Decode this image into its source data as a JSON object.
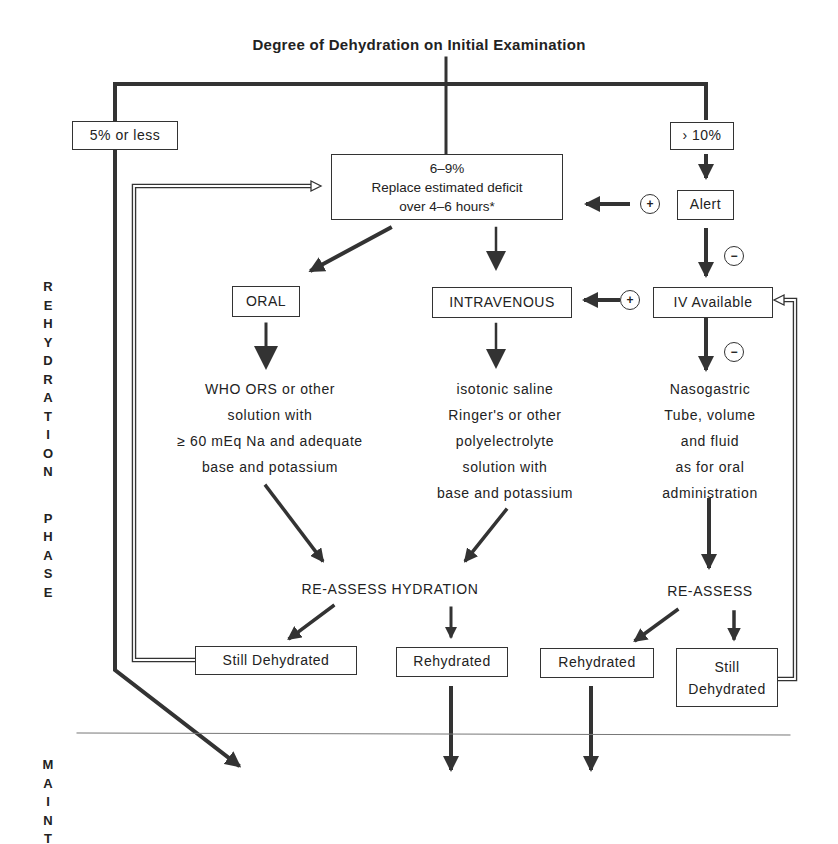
{
  "title": "Degree of Dehydration on Initial Examination",
  "severity": {
    "mild": "5% or less",
    "moderate": [
      "6–9%",
      "Replace estimated deficit",
      "over 4–6 hours*"
    ],
    "severe": "› 10%"
  },
  "decisions": {
    "alert": "Alert",
    "iv_available": "IV Available",
    "alert_yes_sign": "+",
    "alert_no_sign": "−",
    "iv_yes_sign": "+",
    "iv_no_sign": "−"
  },
  "routes": {
    "oral": "ORAL",
    "intravenous": "INTRAVENOUS"
  },
  "solutions": {
    "oral": [
      "WHO ORS or other",
      "solution with",
      "≥ 60 mEq Na and adequate",
      "base and potassium"
    ],
    "iv": [
      "isotonic saline",
      "Ringer's or other",
      "polyelectrolyte",
      "solution with",
      "base and potassium"
    ],
    "ng": [
      "Nasogastric",
      "Tube, volume",
      "and fluid",
      "as for oral",
      "administration"
    ]
  },
  "reassess": {
    "left": "RE-ASSESS HYDRATION",
    "right": "RE-ASSESS"
  },
  "outcomes": {
    "left_still": "Still Dehydrated",
    "left_rehydrated": "Rehydrated",
    "right_rehydrated": "Rehydrated",
    "right_still": [
      "Still",
      "Dehydrated"
    ]
  },
  "phases": {
    "rehydration": [
      "R",
      "E",
      "H",
      "Y",
      "D",
      "R",
      "A",
      "T",
      "I",
      "O",
      "N"
    ],
    "phase": [
      "P",
      "H",
      "A",
      "S",
      "E"
    ],
    "maint": [
      "M",
      "A",
      "I",
      "N",
      "T"
    ]
  },
  "colors": {
    "line": "#333333",
    "text": "#222222",
    "background": "#ffffff"
  }
}
